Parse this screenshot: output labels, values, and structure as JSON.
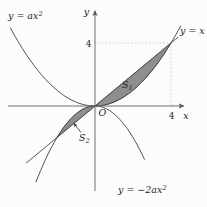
{
  "labels": {
    "parabola_up": {
      "base": "y = ax",
      "sup": "2"
    },
    "line": {
      "text": "y = x"
    },
    "parabola_down": {
      "base": "y = −2ax",
      "sup": "2"
    },
    "region1": {
      "base": "S",
      "sub": "1"
    },
    "region2": {
      "base": "S",
      "sub": "2"
    },
    "origin": "O",
    "x_axis": "x",
    "y_axis": "y",
    "x_tick": "4",
    "y_tick": "4"
  },
  "colors": {
    "region_fill": "#8e8e8e",
    "curve": "#3d3d3d",
    "axis": "#6e6e6e",
    "guide_dots": "#bfbfbf",
    "background": "#fcfcfc"
  },
  "chart_data": {
    "type": "line",
    "subtype": "math-function-plot",
    "title": "",
    "xlabel": "x",
    "ylabel": "y",
    "x_visible_range": [
      -4.6,
      4.9
    ],
    "y_visible_range": [
      -5.4,
      6.2
    ],
    "x_ticks": [
      4
    ],
    "y_ticks": [
      4
    ],
    "grid": false,
    "functions": [
      {
        "name": "parabola-up",
        "label": "y = ax²",
        "type": "quad",
        "k": 0.25,
        "a": 0.25,
        "xmin": -4.45,
        "xmax": 4.5
      },
      {
        "name": "line",
        "label": "y = x",
        "type": "line",
        "k": 1,
        "xmin": -3.6,
        "xmax": 4.35
      },
      {
        "name": "parabola-down",
        "label": "y = −2ax²",
        "type": "quad",
        "k": -0.5,
        "a": 0.25,
        "xmin": -3.1,
        "xmax": 2.6
      }
    ],
    "regions": [
      {
        "name": "S₁",
        "between": [
          "y = x",
          "y = ax²"
        ],
        "upper": 1,
        "lower": 0,
        "xmin": 0,
        "xmax": 4
      },
      {
        "name": "S₂",
        "between": [
          "y = −2ax²",
          "y = x"
        ],
        "upper": 2,
        "lower": 1,
        "xmin": -2,
        "xmax": 0
      }
    ],
    "key_points": [
      {
        "x": 4,
        "y": 4,
        "note": "intersection of y = x and y = ax²"
      },
      {
        "x": -2,
        "y": -2,
        "note": "intersection of y = x and y = −2ax²"
      },
      {
        "x": 0,
        "y": 0,
        "note": "origin O"
      }
    ],
    "guides": [
      {
        "from": [
          0,
          4
        ],
        "corner": [
          4,
          4
        ],
        "to": [
          4,
          0
        ]
      }
    ],
    "transform": {
      "ox": 95,
      "oy": 106,
      "sx": 19,
      "sy": 15.75
    }
  }
}
